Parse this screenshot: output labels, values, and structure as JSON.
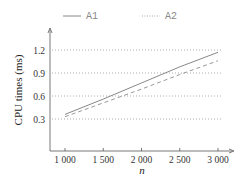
{
  "chart_data": {
    "type": "line",
    "title": "",
    "xlabel": "n",
    "ylabel": "CPU times (ms)",
    "x": [
      1000,
      1500,
      2000,
      2500,
      3000
    ],
    "x_tick_labels": [
      "1 000",
      "1 500",
      "2 000",
      "2 500",
      "3 000"
    ],
    "y_ticks": [
      0.3,
      0.6,
      0.9,
      1.2
    ],
    "y_tick_labels": [
      "0.3",
      "0.6",
      "0.9",
      "1.2"
    ],
    "xlim": [
      800,
      3200
    ],
    "ylim": [
      0.0,
      1.45
    ],
    "grid": "horizontal dotted",
    "legend_position": "top",
    "series": [
      {
        "name": "A1",
        "style": "solid",
        "color": "#888888",
        "values": [
          0.36,
          0.56,
          0.77,
          0.98,
          1.17
        ]
      },
      {
        "name": "A2",
        "style": "dashed",
        "color": "#999999",
        "values": [
          0.33,
          0.51,
          0.69,
          0.88,
          1.06
        ]
      }
    ]
  },
  "legend": {
    "items": [
      {
        "label": "A1",
        "style": "solid"
      },
      {
        "label": "A2",
        "style": "dotted"
      }
    ]
  }
}
